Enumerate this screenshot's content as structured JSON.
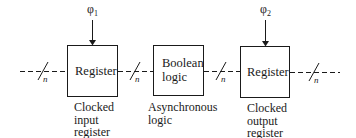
{
  "diagram": {
    "clocks": [
      {
        "symbol": "φ",
        "subscript": "1"
      },
      {
        "symbol": "φ",
        "subscript": "2"
      }
    ],
    "blocks": [
      {
        "id": "input-register",
        "text": "Register",
        "caption": "Clocked\ninput\nregister"
      },
      {
        "id": "boolean-logic",
        "text": "Boolean\nlogic",
        "caption": "Asynchronous\nlogic"
      },
      {
        "id": "output-register",
        "text": "Register",
        "caption": "Clocked\noutput\nregister"
      }
    ],
    "bus_width_label": "n",
    "colors": {
      "line": "#1a1a1a",
      "background": "#ffffff"
    }
  }
}
